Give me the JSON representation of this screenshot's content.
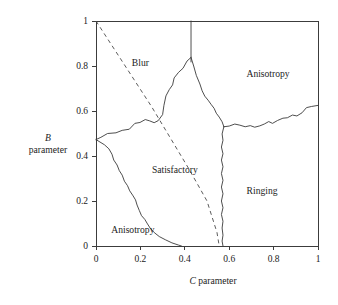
{
  "figure": {
    "kind": "region-phase-diagram",
    "background_color": "#ffffff",
    "line_color": "#3a3a3a"
  },
  "chart_data": {
    "type": "line",
    "title": "",
    "subtitle": "",
    "xlabel": "C parameter",
    "xlabel_italic_symbol": "C",
    "xlabel_rest": " parameter",
    "ylabel": "B parameter",
    "ylabel_italic_symbol": "B",
    "ylabel_rest": "parameter",
    "xlim": [
      0,
      1
    ],
    "ylim": [
      0,
      1
    ],
    "grid": false,
    "legend": "none",
    "xticks": [
      0,
      0.2,
      0.4,
      0.6,
      0.8,
      1
    ],
    "xtick_labels": [
      "0",
      "0.2",
      "0.4",
      "0.6",
      "0.8",
      "1"
    ],
    "yticks": [
      0,
      0.2,
      0.4,
      0.6,
      0.8,
      1
    ],
    "ytick_labels": [
      "0",
      "0.2",
      "0.4",
      "0.6",
      "0.8",
      "1"
    ],
    "region_labels": [
      {
        "name": "blur",
        "text": "Blur",
        "x": 0.2,
        "y": 0.815
      },
      {
        "name": "anisotropy-upper-right",
        "text": "Anisotropy",
        "x": 0.775,
        "y": 0.765
      },
      {
        "name": "satisfactory",
        "text": "Satisfactory",
        "x": 0.355,
        "y": 0.34
      },
      {
        "name": "ringing",
        "text": "Ringing",
        "x": 0.748,
        "y": 0.248
      },
      {
        "name": "anisotropy-lower-left",
        "text": "Anisotropy",
        "x": 0.166,
        "y": 0.073
      }
    ],
    "series": [
      {
        "name": "blur-anisotropy-divider",
        "style": "solid",
        "points": [
          [
            0.428,
            1.0
          ],
          [
            0.428,
            0.818
          ]
        ]
      },
      {
        "name": "left-blur-satisfactory-boundary",
        "style": "solid",
        "points": [
          [
            0.0,
            0.473
          ],
          [
            0.022,
            0.483
          ],
          [
            0.052,
            0.5
          ],
          [
            0.09,
            0.503
          ],
          [
            0.118,
            0.514
          ],
          [
            0.15,
            0.519
          ],
          [
            0.175,
            0.545
          ],
          [
            0.198,
            0.549
          ],
          [
            0.222,
            0.562
          ],
          [
            0.242,
            0.556
          ],
          [
            0.262,
            0.548
          ],
          [
            0.28,
            0.557
          ],
          [
            0.3,
            0.584
          ],
          [
            0.306,
            0.625
          ],
          [
            0.315,
            0.667
          ],
          [
            0.33,
            0.695
          ],
          [
            0.345,
            0.716
          ],
          [
            0.352,
            0.747
          ],
          [
            0.372,
            0.772
          ],
          [
            0.392,
            0.79
          ],
          [
            0.41,
            0.822
          ],
          [
            0.428,
            0.838
          ]
        ]
      },
      {
        "name": "right-satisfactory-anisotropy-boundary",
        "style": "solid",
        "points": [
          [
            0.428,
            0.838
          ],
          [
            0.44,
            0.8
          ],
          [
            0.452,
            0.758
          ],
          [
            0.468,
            0.72
          ],
          [
            0.478,
            0.69
          ],
          [
            0.49,
            0.666
          ],
          [
            0.505,
            0.648
          ],
          [
            0.518,
            0.63
          ],
          [
            0.532,
            0.612
          ],
          [
            0.542,
            0.59
          ],
          [
            0.555,
            0.573
          ],
          [
            0.568,
            0.552
          ],
          [
            0.576,
            0.53
          ]
        ]
      },
      {
        "name": "upper-right-anisotropy-ringing-boundary",
        "style": "solid",
        "points": [
          [
            0.576,
            0.53
          ],
          [
            0.6,
            0.533
          ],
          [
            0.625,
            0.542
          ],
          [
            0.648,
            0.537
          ],
          [
            0.672,
            0.53
          ],
          [
            0.695,
            0.535
          ],
          [
            0.715,
            0.528
          ],
          [
            0.738,
            0.534
          ],
          [
            0.758,
            0.542
          ],
          [
            0.778,
            0.553
          ],
          [
            0.795,
            0.545
          ],
          [
            0.818,
            0.558
          ],
          [
            0.842,
            0.568
          ],
          [
            0.862,
            0.57
          ],
          [
            0.885,
            0.582
          ],
          [
            0.905,
            0.578
          ],
          [
            0.928,
            0.592
          ],
          [
            0.948,
            0.615
          ],
          [
            0.97,
            0.62
          ],
          [
            1.0,
            0.625
          ]
        ]
      },
      {
        "name": "satisfactory-ringing-boundary",
        "style": "solid",
        "points": [
          [
            0.576,
            0.53
          ],
          [
            0.568,
            0.498
          ],
          [
            0.572,
            0.47
          ],
          [
            0.565,
            0.44
          ],
          [
            0.572,
            0.41
          ],
          [
            0.565,
            0.382
          ],
          [
            0.572,
            0.352
          ],
          [
            0.565,
            0.322
          ],
          [
            0.572,
            0.292
          ],
          [
            0.565,
            0.262
          ],
          [
            0.572,
            0.232
          ],
          [
            0.565,
            0.2
          ],
          [
            0.572,
            0.17
          ],
          [
            0.565,
            0.14
          ],
          [
            0.572,
            0.11
          ],
          [
            0.568,
            0.08
          ],
          [
            0.572,
            0.048
          ],
          [
            0.568,
            0.022
          ],
          [
            0.572,
            0.0
          ]
        ]
      },
      {
        "name": "anisotropy-satisfactory-left-boundary",
        "style": "solid",
        "points": [
          [
            0.0,
            0.473
          ],
          [
            0.018,
            0.462
          ],
          [
            0.038,
            0.45
          ],
          [
            0.058,
            0.432
          ],
          [
            0.072,
            0.408
          ],
          [
            0.08,
            0.382
          ],
          [
            0.095,
            0.36
          ],
          [
            0.105,
            0.335
          ],
          [
            0.118,
            0.315
          ],
          [
            0.128,
            0.288
          ],
          [
            0.142,
            0.268
          ],
          [
            0.152,
            0.245
          ],
          [
            0.165,
            0.226
          ],
          [
            0.178,
            0.205
          ],
          [
            0.185,
            0.182
          ],
          [
            0.195,
            0.158
          ],
          [
            0.205,
            0.135
          ],
          [
            0.22,
            0.118
          ],
          [
            0.232,
            0.098
          ],
          [
            0.245,
            0.078
          ],
          [
            0.262,
            0.06
          ],
          [
            0.285,
            0.042
          ],
          [
            0.312,
            0.028
          ],
          [
            0.342,
            0.014
          ],
          [
            0.372,
            0.004
          ],
          [
            0.385,
            0.0
          ]
        ]
      },
      {
        "name": "dashed-guide-line",
        "style": "dashed",
        "points": [
          [
            0.0,
            1.0
          ],
          [
            0.25,
            0.62
          ],
          [
            0.42,
            0.34
          ],
          [
            0.5,
            0.2
          ],
          [
            0.545,
            0.06
          ],
          [
            0.555,
            0.0
          ]
        ]
      }
    ]
  }
}
